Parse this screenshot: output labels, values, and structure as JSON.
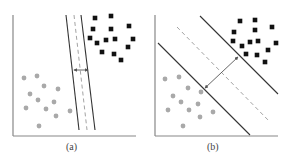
{
  "figure": {
    "panels": [
      {
        "id": "a",
        "caption": "(a)",
        "description": "Narrow margin separating hyperplane",
        "axes": {
          "origin": [
            13,
            136
          ],
          "y_top": 15,
          "x_right": 136
        },
        "lines": {
          "left_solid": [
            [
              66,
              15
            ],
            [
              79,
              130
            ]
          ],
          "center_dashed": [
            [
              74,
              15
            ],
            [
              87,
              130
            ]
          ],
          "right_solid": [
            [
              81,
              15
            ],
            [
              95,
              130
            ]
          ]
        },
        "margin_arrow": [
          [
            74,
            70
          ],
          [
            88,
            70
          ]
        ],
        "squares": [
          [
            95,
            18
          ],
          [
            111,
            16
          ],
          [
            93,
            29
          ],
          [
            111,
            29
          ],
          [
            129,
            26
          ],
          [
            90,
            38
          ],
          [
            97,
            43
          ],
          [
            106,
            40
          ],
          [
            115,
            39
          ],
          [
            133,
            39
          ],
          [
            128,
            47
          ],
          [
            102,
            52
          ],
          [
            114,
            54
          ],
          [
            121,
            60
          ]
        ],
        "circles": [
          [
            24,
            78
          ],
          [
            37,
            76
          ],
          [
            44,
            86
          ],
          [
            58,
            89
          ],
          [
            30,
            94
          ],
          [
            38,
            100
          ],
          [
            54,
            102
          ],
          [
            26,
            108
          ],
          [
            46,
            109
          ],
          [
            70,
            111
          ],
          [
            56,
            116
          ],
          [
            39,
            126
          ]
        ]
      },
      {
        "id": "b",
        "caption": "(b)",
        "description": "Maximum margin separating hyperplane",
        "axes": {
          "origin": [
            155,
            136
          ],
          "y_top": 15,
          "x_right": 278
        },
        "lines": {
          "lower_solid": [
            [
              158,
              43
            ],
            [
              250,
              135
            ]
          ],
          "center_dashed": [
            [
              177,
              27
            ],
            [
              270,
              122
            ]
          ],
          "upper_solid": [
            [
              200,
              16
            ],
            [
              278,
              94
            ]
          ]
        },
        "margin_arrow": [
          [
            205,
            88
          ],
          [
            238,
            57
          ]
        ],
        "squares": [
          [
            240,
            21
          ],
          [
            255,
            20
          ],
          [
            234,
            32
          ],
          [
            255,
            30
          ],
          [
            272,
            27
          ],
          [
            233,
            41
          ],
          [
            242,
            46
          ],
          [
            250,
            42
          ],
          [
            258,
            41
          ],
          [
            276,
            43
          ],
          [
            268,
            50
          ],
          [
            246,
            54
          ],
          [
            257,
            55
          ],
          [
            265,
            62
          ]
        ],
        "circles": [
          [
            165,
            79
          ],
          [
            179,
            77
          ],
          [
            188,
            88
          ],
          [
            201,
            92
          ],
          [
            173,
            96
          ],
          [
            181,
            102
          ],
          [
            198,
            104
          ],
          [
            168,
            110
          ],
          [
            189,
            110
          ],
          [
            213,
            112
          ],
          [
            200,
            117
          ],
          [
            183,
            126
          ]
        ]
      }
    ],
    "colors": {
      "square": "#111111",
      "circle": "#a9a9a9",
      "axis": "#888888",
      "solid_line": "#333333",
      "dashed_line": "#999999",
      "arrow": "#555555"
    }
  }
}
